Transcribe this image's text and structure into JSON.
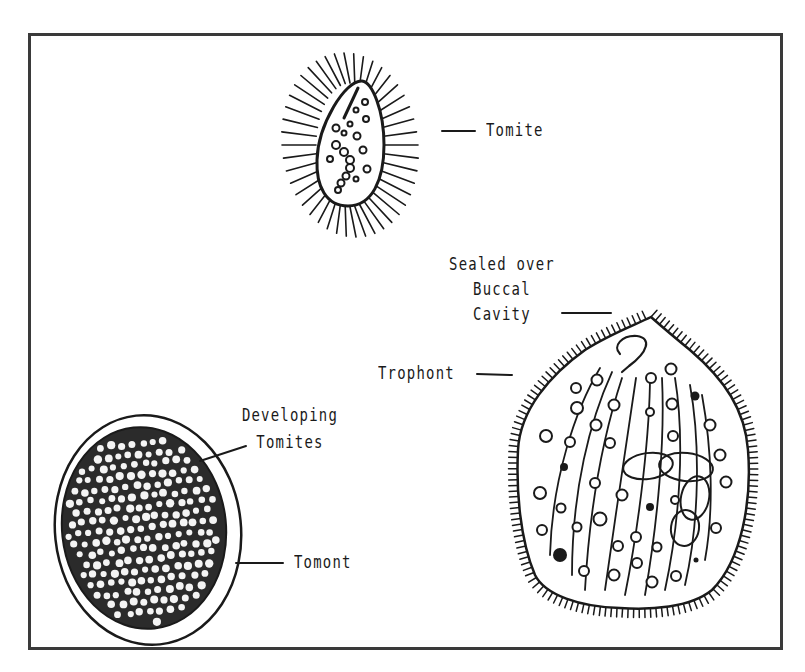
{
  "figure": {
    "type": "life-cycle diagram",
    "colors": {
      "ink": "#1a1a1a",
      "frame": "#3a3a3a",
      "background": "#ffffff"
    }
  },
  "labels": {
    "tomite": "Tomite",
    "sealed_line1": "Sealed over",
    "sealed_line2": "Buccal",
    "sealed_line3": "Cavity",
    "trophont": "Trophont",
    "developing_line1": "Developing",
    "developing_line2": "Tomites",
    "tomont": "Tomont"
  },
  "stages": [
    {
      "name": "Tomite",
      "depiction": "small ciliated teardrop cell with granules"
    },
    {
      "name": "Trophont",
      "depiction": "large ciliated pear-shaped cell with sealed over buccal cavity, kineties and vacuoles"
    },
    {
      "name": "Tomont",
      "depiction": "encysted round cell filled with developing tomites"
    }
  ]
}
